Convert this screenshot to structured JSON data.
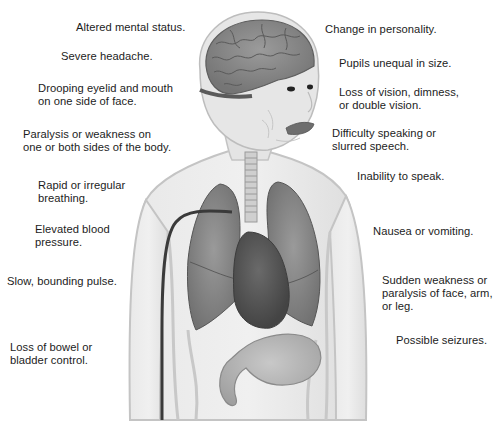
{
  "figure": {
    "colors": {
      "background": "#ffffff",
      "text": "#1c1c1c",
      "skin": "#e6e6e6",
      "skin_outline": "#c4c4c4",
      "brain": "#8a8a8a",
      "brain_folds": "#5e5e5e",
      "lungs": "#868686",
      "heart": "#5a5a5a",
      "stomach": "#b3b3b3",
      "artery_line": "#3a3a3a",
      "lips": "#6e6e6e"
    }
  },
  "labels_left": [
    {
      "id": "altered-mental-status",
      "text": "Altered mental status."
    },
    {
      "id": "severe-headache",
      "text": "Severe headache."
    },
    {
      "id": "drooping-eyelid",
      "text": "Drooping eyelid and mouth\non one side of face."
    },
    {
      "id": "paralysis-weakness",
      "text": "Paralysis or weakness on\none or both sides of the body."
    },
    {
      "id": "rapid-breathing",
      "text": "Rapid or irregular\nbreathing."
    },
    {
      "id": "elevated-bp",
      "text": "Elevated blood\npressure."
    },
    {
      "id": "slow-pulse",
      "text": "Slow, bounding pulse."
    },
    {
      "id": "loss-bowel",
      "text": "Loss of bowel or\nbladder control."
    }
  ],
  "labels_right": [
    {
      "id": "change-personality",
      "text": "Change in personality."
    },
    {
      "id": "pupils-unequal",
      "text": "Pupils unequal in size."
    },
    {
      "id": "loss-vision",
      "text": "Loss of vision, dimness,\nor double vision."
    },
    {
      "id": "difficulty-speaking",
      "text": "Difficulty speaking or\nslurred speech."
    },
    {
      "id": "inability-speak",
      "text": "Inability to speak."
    },
    {
      "id": "nausea",
      "text": "Nausea or vomiting."
    },
    {
      "id": "sudden-weakness",
      "text": "Sudden weakness or\nparalysis of face, arm,\nor leg."
    },
    {
      "id": "seizures",
      "text": "Possible seizures."
    }
  ],
  "caption": {
    "visible_text": "",
    "note": "caption cropped at bottom edge; only tops of glyphs visible"
  }
}
